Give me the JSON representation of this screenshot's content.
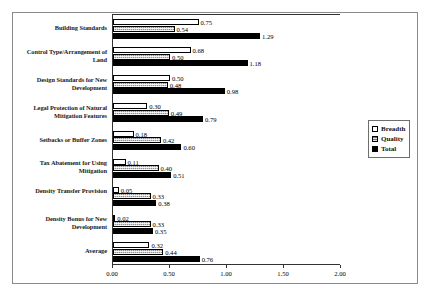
{
  "chart_data": {
    "type": "bar",
    "orientation": "horizontal",
    "title": "",
    "subtitle": "",
    "xlabel": "",
    "ylabel": "",
    "xlim": [
      0.0,
      2.0
    ],
    "xticks": [
      "0.00",
      "0.50",
      "1.00",
      "1.50",
      "2.00"
    ],
    "xtick_values": [
      0.0,
      0.5,
      1.0,
      1.5,
      2.0
    ],
    "grid": false,
    "legend_position": "right",
    "categories": [
      "Building Standards",
      "Control Type/Arrangement of Land",
      "Design Standards for New Development",
      "Legal Protection of Natural Mitigation Features",
      "Setbacks or Buffer Zones",
      "Tax Abatement for Using Mitigation",
      "Density Transfer Provision",
      "Density Bonus for New Development",
      "Average"
    ],
    "series": [
      {
        "name": "Breadth",
        "fill": "white",
        "values": [
          0.75,
          0.68,
          0.5,
          0.3,
          0.18,
          0.11,
          0.05,
          0.02,
          0.32
        ],
        "labels": [
          "0.75",
          "0.68",
          "0.50",
          "0.30",
          "0.18",
          "0.11",
          "0.05",
          "0.02",
          "0.32"
        ]
      },
      {
        "name": "Quality",
        "fill": "hatched",
        "values": [
          0.54,
          0.5,
          0.48,
          0.49,
          0.42,
          0.4,
          0.33,
          0.33,
          0.44
        ],
        "labels": [
          "0.54",
          "0.50",
          "0.48",
          "0.49",
          "0.42",
          "0.40",
          "0.33",
          "0.33",
          "0.44"
        ]
      },
      {
        "name": "Total",
        "fill": "black",
        "values": [
          1.29,
          1.18,
          0.98,
          0.79,
          0.6,
          0.51,
          0.38,
          0.35,
          0.76
        ],
        "labels": [
          "1.29",
          "1.18",
          "0.98",
          "0.79",
          "0.60",
          "0.51",
          "0.38",
          "0.35",
          "0.76"
        ]
      }
    ]
  },
  "legend": {
    "items": [
      {
        "label": "Breadth",
        "swatch": "white-square-icon"
      },
      {
        "label": "Quality",
        "swatch": "hatched-square-icon"
      },
      {
        "label": "Total",
        "swatch": "black-square-icon"
      }
    ]
  },
  "colors": {
    "breadth": "#ffffff",
    "quality": "#909090",
    "total": "#000000",
    "axis": "#333333",
    "frame": "#8a8a8a"
  }
}
